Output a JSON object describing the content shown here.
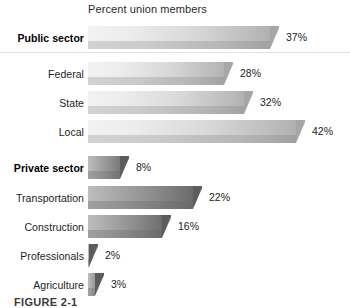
{
  "chart_data": {
    "type": "bar",
    "orientation": "horizontal",
    "title": "Percent union members",
    "xlabel": "",
    "ylabel": "",
    "xlim": [
      0,
      42
    ],
    "grid": false,
    "legend": null,
    "categories": [
      "Public sector",
      "Federal",
      "State",
      "Local",
      "Private sector",
      "Transportation",
      "Construction",
      "Professionals",
      "Agriculture"
    ],
    "values": [
      37,
      28,
      32,
      42,
      8,
      22,
      16,
      2,
      3
    ],
    "data_labels": [
      "37%",
      "28%",
      "32%",
      "42%",
      "8%",
      "22%",
      "16%",
      "2%",
      "3%"
    ],
    "bars": [
      {
        "label": "Public sector",
        "value": 37,
        "data_label": "37%",
        "bold": true,
        "group": "public"
      },
      {
        "label": "Federal",
        "value": 28,
        "data_label": "28%",
        "bold": false,
        "group": "public"
      },
      {
        "label": "State",
        "value": 32,
        "data_label": "32%",
        "bold": false,
        "group": "public"
      },
      {
        "label": "Local",
        "value": 42,
        "data_label": "42%",
        "bold": false,
        "group": "public"
      },
      {
        "label": "Private sector",
        "value": 8,
        "data_label": "8%",
        "bold": true,
        "group": "private"
      },
      {
        "label": "Transportation",
        "value": 22,
        "data_label": "22%",
        "bold": false,
        "group": "private"
      },
      {
        "label": "Construction",
        "value": 16,
        "data_label": "16%",
        "bold": false,
        "group": "private"
      },
      {
        "label": "Professionals",
        "value": 2,
        "data_label": "2%",
        "bold": false,
        "group": "private"
      },
      {
        "label": "Agriculture",
        "value": 3,
        "data_label": "3%",
        "bold": false,
        "group": "private"
      }
    ],
    "colors": {
      "public_bar_light": "#f2f2f2",
      "public_bar_dark": "#ababab",
      "private_bar_light": "#bdbdbd",
      "private_bar_dark": "#5f5f5f",
      "text": "#1d1d1d",
      "background": "#ffffff",
      "rule": "#e3e3e3"
    }
  },
  "figure": {
    "caption": "FIGURE 2-1"
  }
}
